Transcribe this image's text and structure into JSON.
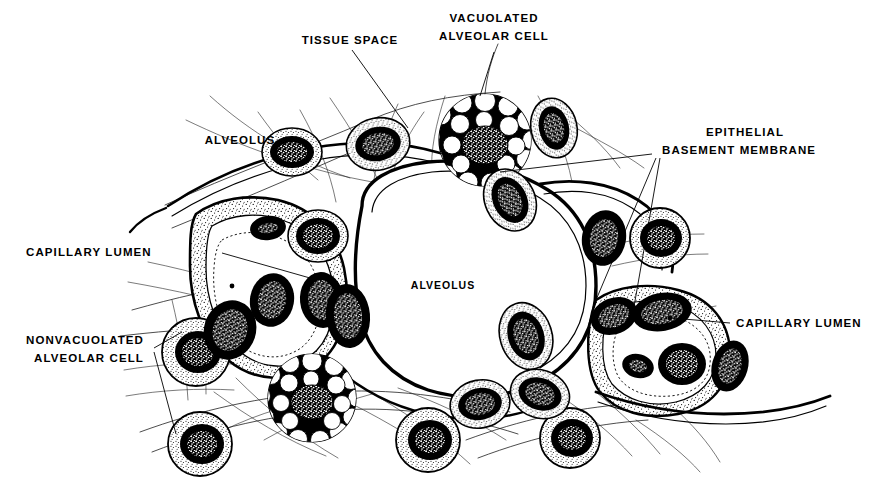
{
  "figure": {
    "kind": "histology-line-drawing",
    "background_color": "#ffffff",
    "ink_color": "#000000"
  },
  "labels": {
    "tissue_space": "TISSUE SPACE",
    "vacuolated_cell_line1": "VACUOLATED",
    "vacuolated_cell_line2": "ALVEOLAR CELL",
    "epithelial_line1": "EPITHELIAL",
    "epithelial_line2": "BASEMENT MEMBRANE",
    "alveolus_top_left": "ALVEOLUS",
    "alveolus_center": "ALVEOLUS",
    "capillary_lumen_left": "CAPILLARY LUMEN",
    "capillary_lumen_right": "CAPILLARY LUMEN",
    "nonvacuolated_line1": "NONVACUOLATED",
    "nonvacuolated_line2": "ALVEOLAR CELL"
  },
  "structures": [
    {
      "id": "alveolus-central",
      "name": "Central alveolus air space",
      "type": "air-space"
    },
    {
      "id": "alveolus-upper-left",
      "name": "Upper left alveolus air space",
      "type": "air-space"
    },
    {
      "id": "vacuolated-cell-top",
      "name": "Vacuolated alveolar cell (top)",
      "type": "cell"
    },
    {
      "id": "vacuolated-cell-bottom",
      "name": "Vacuolated alveolar cell (bottom)",
      "type": "cell"
    },
    {
      "id": "nonvacuolated-cell-left",
      "name": "Nonvacuolated alveolar cell (left)",
      "type": "cell"
    },
    {
      "id": "capillary-lumen-left",
      "name": "Capillary lumen (left)",
      "type": "lumen"
    },
    {
      "id": "capillary-lumen-right",
      "name": "Capillary lumen (right)",
      "type": "lumen"
    },
    {
      "id": "epithelial-basement-membrane",
      "name": "Epithelial basement membrane",
      "type": "membrane"
    },
    {
      "id": "connective-tissue-fibers",
      "name": "Connective tissue fiber network",
      "type": "fiber-network"
    }
  ]
}
